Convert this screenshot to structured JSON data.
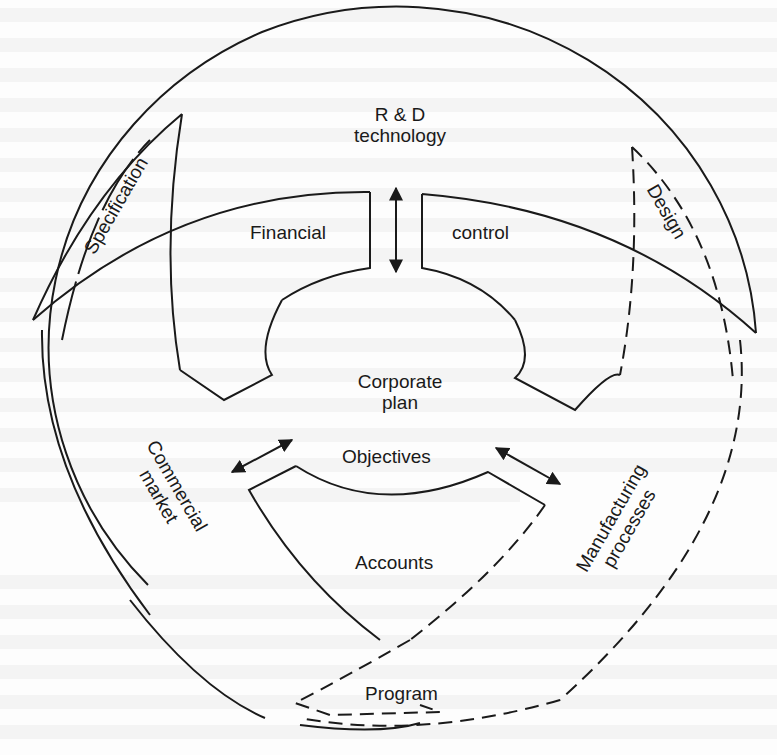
{
  "figure": {
    "type": "cyclical-planning-diagram",
    "stroke_color": "#1a1a1a",
    "background_color": "#fdfdfd"
  },
  "center": {
    "title_line1": "Corporate",
    "title_line2": "plan",
    "objectives": "Objectives"
  },
  "inner_segments": {
    "financial": "Financial",
    "control": "control",
    "accounts": "Accounts"
  },
  "outer_nodes": {
    "rd_line1": "R & D",
    "rd_line2": "technology",
    "commercial_line1": "Commercial",
    "commercial_line2": "market",
    "manufacturing_line1": "Manufacturing",
    "manufacturing_line2": "processes"
  },
  "outer_slivers": {
    "specification": "Specification",
    "design": "Design",
    "program": "Program"
  },
  "arrows": [
    {
      "name": "rd-arrow",
      "between": [
        "R & D technology",
        "Corporate plan"
      ],
      "direction": "both"
    },
    {
      "name": "commercial-arrow",
      "between": [
        "Commercial market",
        "Corporate plan"
      ],
      "direction": "both"
    },
    {
      "name": "manufacturing-arrow",
      "between": [
        "Manufacturing processes",
        "Corporate plan"
      ],
      "direction": "both"
    }
  ]
}
